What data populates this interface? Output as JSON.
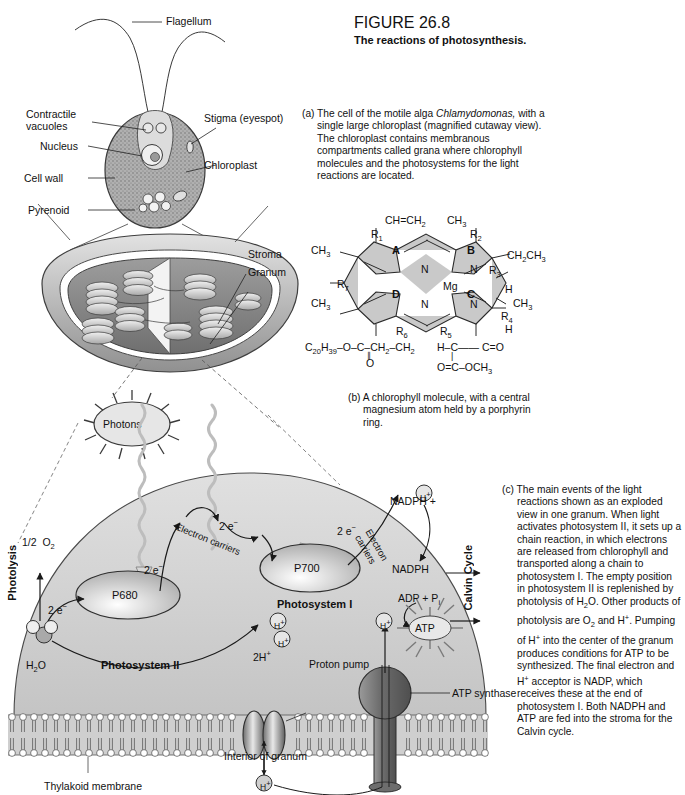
{
  "figure": {
    "number": "FIGURE 26.8",
    "title": "The reactions of photosynthesis."
  },
  "captions": {
    "a_marker": "(a)",
    "a_text": "The cell of the motile alga Chlamydomonas, with a single large chloroplast (magnified cutaway view). The chloroplast contains membranous compartments called grana where chlorophyll molecules and the photosystems for the light reactions are located.",
    "a_italic_word": "Chlamydomonas,",
    "b_marker": "(b)",
    "b_text": "A chlorophyll molecule, with a central magnesium atom held by a porphyrin ring.",
    "c_marker": "(c)",
    "c_text": "The main events of the light reactions shown as an exploded view in one granum. When light activates photosystem II, it sets up a chain reaction, in which electrons are released from chlorophyll and transported along a chain to photosystem I. The empty position in photosystem II is replenished by photolysis of H2O. Other products of photolysis are O2 and H+. Pumping of H+ into the center of the granum produces conditions for ATP to be synthesized. The final electron and H+ acceptor is NADP, which receives these at the end of photosystem I. Both NADPH and ATP are fed into the stroma for the Calvin cycle."
  },
  "cell_diagram": {
    "flagellum": "Flagellum",
    "contractile_vacuoles": "Contractile vacuoles",
    "nucleus": "Nucleus",
    "cell_wall": "Cell wall",
    "pyrenoid": "Pyrenoid",
    "stigma": "Stigma (eyespot)",
    "chloroplast": "Chloroplast"
  },
  "chloroplast_diagram": {
    "stroma": "Stroma",
    "granum": "Granum"
  },
  "chlorophyll": {
    "ring_A": "A",
    "ring_B": "B",
    "ring_C": "C",
    "ring_D": "D",
    "metal": "Mg",
    "nitrogens": [
      "N",
      "N",
      "N",
      "N"
    ],
    "substituents": {
      "vinyl": "CH=CH2",
      "methyl_top_right": "CH3",
      "r1": "R1",
      "r2": "R2",
      "methyl_left": "CH3",
      "ethyl": "CH2CH3",
      "r3": "R3",
      "r7": "R7",
      "methyl_lower_left": "CH3",
      "h_upper_right": "H",
      "methyl_right": "CH3",
      "r4": "R4",
      "h_lower_right": "H",
      "r5": "R5",
      "r6": "R6"
    },
    "tail_left": "C20H39-O-C-CH2-CH2",
    "tail_left_carbonyl": "O",
    "tail_right_top": "H-C",
    "tail_right_carbonyl": "C=O",
    "tail_right_bottom": "O=C-OCH3"
  },
  "granum_diagram": {
    "photons": "Photons",
    "photolysis": "Photolysis",
    "half_o2": "1/2 O2",
    "water": "H2O",
    "two_e_left": "2 e-",
    "two_e_p680": "2 e-",
    "two_e_chain": "2 e-",
    "two_e_ps1": "2 e-",
    "electron_carriers_1": "Electron carriers",
    "electron_carriers_2": "Electron carriers",
    "p680": "P680",
    "p700": "P700",
    "photosystem_2": "Photosystem II",
    "photosystem_1": "Photosystem I",
    "nadph_h": "NADPH +",
    "nadph": "NADPH",
    "adp_pi": "ADP + Pi",
    "atp": "ATP",
    "calvin_cycle": "Calvin Cycle",
    "two_h_plus": "2H+",
    "proton_pump": "Proton pump",
    "atp_synthase": "ATP synthase",
    "thylakoid_membrane": "Thylakoid membrane",
    "interior_of_granum": "Interior of granum",
    "proton_symbol": "H+"
  },
  "colors": {
    "stroma_fill": "#d4d4d4",
    "ring_fill": "#c9c9c9",
    "membrane": "#b8b8b8",
    "outline": "#1a1a1a",
    "photon_ray": "#c0c0c0"
  }
}
